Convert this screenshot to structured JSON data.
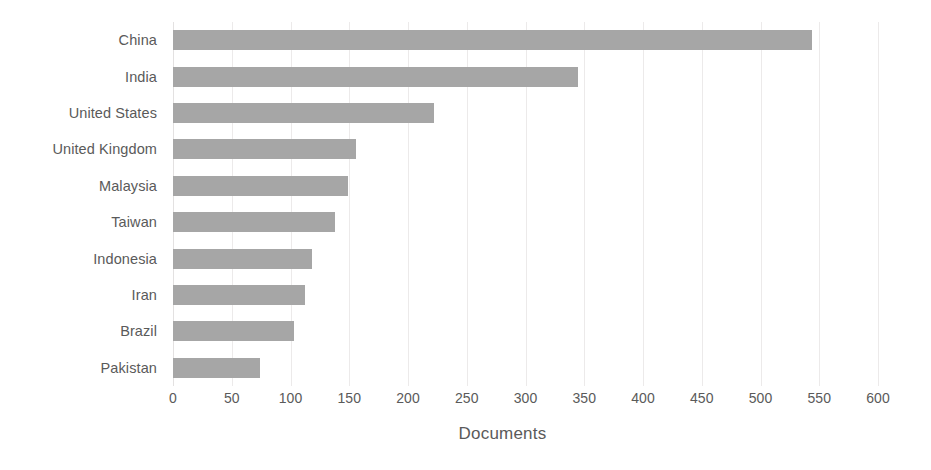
{
  "chart_data": {
    "type": "bar",
    "orientation": "horizontal",
    "title": "",
    "subtitle": "",
    "xlabel": "Documents",
    "ylabel": "",
    "categories": [
      "China",
      "India",
      "United States",
      "United Kingdom",
      "Malaysia",
      "Taiwan",
      "Indonesia",
      "Iran",
      "Brazil",
      "Pakistan"
    ],
    "values": [
      544,
      345,
      222,
      156,
      149,
      138,
      118,
      112,
      103,
      74
    ],
    "series": [
      {
        "name": "Documents",
        "values": [
          544,
          345,
          222,
          156,
          149,
          138,
          118,
          112,
          103,
          74
        ]
      }
    ],
    "xlim": [
      0,
      600
    ],
    "xticks": [
      0,
      50,
      100,
      150,
      200,
      250,
      300,
      350,
      400,
      450,
      500,
      550,
      600
    ],
    "xtick_labels": [
      "0",
      "50",
      "100",
      "150",
      "200",
      "250",
      "300",
      "350",
      "400",
      "450",
      "500",
      "550",
      "600"
    ],
    "grid": true,
    "grid_axis": "x",
    "legend": false,
    "legend_position": "none",
    "bar_color": "#a6a6a6",
    "grid_color": "#eceaea",
    "text_color": "#5a5a5a",
    "background_color": "#ffffff"
  }
}
